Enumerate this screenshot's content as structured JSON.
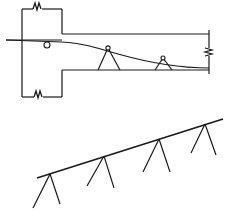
{
  "figure": {
    "type": "engineering-line-drawing",
    "title": "",
    "background_color": "#ffffff",
    "line_color": "#1a1a1a",
    "views": [
      {
        "name": "plan-view",
        "label": "",
        "description": "Upper view: horizontal structure outline with sagging cable and two A-frame supports",
        "elements": [
          {
            "name": "left-vertical-edge",
            "kind": "line",
            "x1": 22,
            "y1": 9,
            "x2": 22,
            "y2": 97
          },
          {
            "name": "top-horizontal-edge",
            "kind": "line",
            "x1": 22,
            "y1": 9,
            "x2": 62,
            "y2": 9
          },
          {
            "name": "top-break-symbol",
            "kind": "break",
            "x": 37,
            "y": 9
          },
          {
            "name": "inner-vertical-top",
            "kind": "line",
            "x1": 62,
            "y1": 9,
            "x2": 62,
            "y2": 34
          },
          {
            "name": "upper-deck-line",
            "kind": "line",
            "x1": 62,
            "y1": 34,
            "x2": 209,
            "y2": 34
          },
          {
            "name": "reference-horizontal-line",
            "kind": "line",
            "x1": 6,
            "y1": 40,
            "x2": 62,
            "y2": 40
          },
          {
            "name": "cable-curve",
            "kind": "curve",
            "start": [
              6,
              40
            ],
            "end": [
              209,
              68
            ]
          },
          {
            "name": "hinge-circle",
            "kind": "circle",
            "cx": 47,
            "cy": 45,
            "r": 3
          },
          {
            "name": "inner-vertical-bottom",
            "kind": "line",
            "x1": 62,
            "y1": 70,
            "x2": 62,
            "y2": 97
          },
          {
            "name": "lower-deck-line",
            "kind": "line",
            "x1": 62,
            "y1": 70,
            "x2": 209,
            "y2": 70
          },
          {
            "name": "bottom-horizontal-edge",
            "kind": "line",
            "x1": 22,
            "y1": 97,
            "x2": 62,
            "y2": 97
          },
          {
            "name": "bottom-break-symbol",
            "kind": "break",
            "x": 38,
            "y": 97
          },
          {
            "name": "right-vertical-edge",
            "kind": "line",
            "x1": 209,
            "y1": 30,
            "x2": 209,
            "y2": 74
          },
          {
            "name": "right-arrow-mark",
            "kind": "arrow",
            "x": 209,
            "y": 52
          }
        ],
        "supports": [
          {
            "name": "support-1",
            "apex": [
              108,
              48
            ],
            "left_foot": [
              98,
              70
            ],
            "right_foot": [
              120,
              70
            ],
            "node_marker": true
          },
          {
            "name": "support-2",
            "apex": [
              163,
              58
            ],
            "left_foot": [
              155,
              70
            ],
            "right_foot": [
              172,
              70
            ],
            "node_marker": true
          }
        ]
      },
      {
        "name": "elevation-view",
        "label": "",
        "description": "Lower view: inclined line with four A-frame tower supports",
        "main_line": {
          "name": "inclined-cable",
          "x1": 37,
          "y1": 178,
          "x2": 223,
          "y2": 119
        },
        "supports": [
          {
            "name": "tower-1",
            "apex": [
              50,
              174
            ],
            "left_foot": [
              33,
              208
            ],
            "right_foot": [
              60,
              204
            ]
          },
          {
            "name": "tower-2",
            "apex": [
              104,
              156
            ],
            "left_foot": [
              87,
              186
            ],
            "right_foot": [
              114,
              188
            ]
          },
          {
            "name": "tower-3",
            "apex": [
              159,
              139
            ],
            "left_foot": [
              143,
              172
            ],
            "right_foot": [
              170,
              172
            ]
          },
          {
            "name": "tower-4",
            "apex": [
              205,
              124
            ],
            "left_foot": [
              191,
              153
            ],
            "right_foot": [
              216,
              155
            ]
          }
        ]
      }
    ]
  }
}
